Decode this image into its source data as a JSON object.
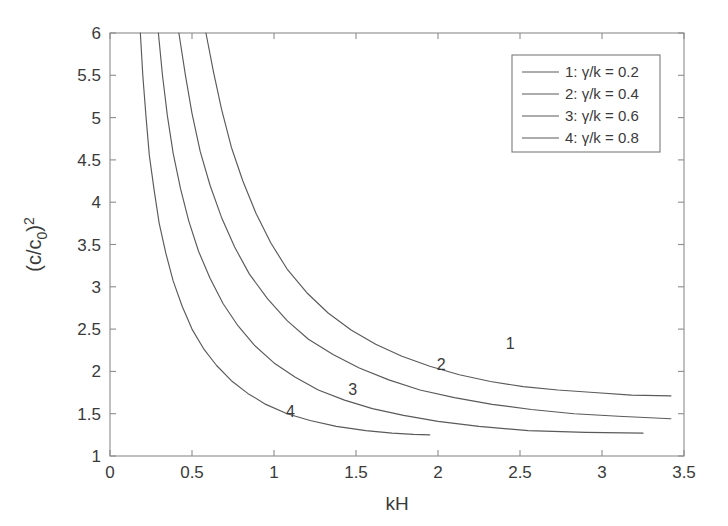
{
  "chart_data": {
    "type": "line",
    "title": "",
    "xlabel": "kH",
    "ylabel": "(c/c_0)^2",
    "ylabel_parts": {
      "base": "(c/c",
      "sub": "0",
      "close": ")",
      "sup": "2"
    },
    "xlim": [
      0,
      3.5
    ],
    "ylim": [
      1,
      6
    ],
    "xticks": [
      "0",
      "0.5",
      "1",
      "1.5",
      "2",
      "2.5",
      "3",
      "3.5"
    ],
    "xtick_values": [
      0,
      0.5,
      1,
      1.5,
      2,
      2.5,
      3,
      3.5
    ],
    "yticks": [
      "1",
      "1.5",
      "2",
      "2.5",
      "3",
      "3.5",
      "4",
      "4.5",
      "5",
      "5.5",
      "6"
    ],
    "ytick_values": [
      1,
      1.5,
      2,
      2.5,
      3,
      3.5,
      4,
      4.5,
      5,
      5.5,
      6
    ],
    "grid": false,
    "legend_position": "upper-right",
    "line_color": "#5a5a5a",
    "axis_color": "#8c8c8c",
    "text_color": "#3a3a3a",
    "series": [
      {
        "name": "1: γ/k = 0.2",
        "curve_label": "1",
        "gamma_over_k": 0.2,
        "label_point": [
          2.44,
          2.26
        ],
        "points": [
          [
            0.585,
            6.0
          ],
          [
            0.63,
            5.55
          ],
          [
            0.68,
            5.1
          ],
          [
            0.74,
            4.65
          ],
          [
            0.81,
            4.25
          ],
          [
            0.89,
            3.87
          ],
          [
            0.98,
            3.52
          ],
          [
            1.08,
            3.21
          ],
          [
            1.2,
            2.93
          ],
          [
            1.33,
            2.69
          ],
          [
            1.47,
            2.49
          ],
          [
            1.62,
            2.32
          ],
          [
            1.78,
            2.18
          ],
          [
            1.95,
            2.06
          ],
          [
            2.13,
            1.96
          ],
          [
            2.32,
            1.88
          ],
          [
            2.52,
            1.82
          ],
          [
            2.73,
            1.78
          ],
          [
            2.95,
            1.75
          ],
          [
            3.18,
            1.72
          ],
          [
            3.42,
            1.71
          ]
        ]
      },
      {
        "name": "2: γ/k = 0.4",
        "curve_label": "2",
        "gamma_over_k": 0.4,
        "label_point": [
          2.02,
          2.02
        ],
        "points": [
          [
            0.42,
            6.0
          ],
          [
            0.46,
            5.5
          ],
          [
            0.5,
            5.05
          ],
          [
            0.55,
            4.6
          ],
          [
            0.61,
            4.2
          ],
          [
            0.68,
            3.82
          ],
          [
            0.76,
            3.47
          ],
          [
            0.85,
            3.15
          ],
          [
            0.96,
            2.86
          ],
          [
            1.08,
            2.6
          ],
          [
            1.21,
            2.38
          ],
          [
            1.36,
            2.2
          ],
          [
            1.52,
            2.04
          ],
          [
            1.7,
            1.9
          ],
          [
            1.89,
            1.78
          ],
          [
            2.1,
            1.69
          ],
          [
            2.33,
            1.61
          ],
          [
            2.57,
            1.55
          ],
          [
            2.83,
            1.5
          ],
          [
            3.1,
            1.47
          ],
          [
            3.42,
            1.44
          ]
        ]
      },
      {
        "name": "3: γ/k = 0.6",
        "curve_label": "3",
        "gamma_over_k": 0.6,
        "label_point": [
          1.48,
          1.72
        ],
        "points": [
          [
            0.295,
            6.0
          ],
          [
            0.32,
            5.5
          ],
          [
            0.35,
            5.02
          ],
          [
            0.385,
            4.58
          ],
          [
            0.43,
            4.16
          ],
          [
            0.48,
            3.78
          ],
          [
            0.54,
            3.42
          ],
          [
            0.61,
            3.1
          ],
          [
            0.69,
            2.8
          ],
          [
            0.78,
            2.54
          ],
          [
            0.88,
            2.31
          ],
          [
            1.0,
            2.1
          ],
          [
            1.13,
            1.93
          ],
          [
            1.27,
            1.78
          ],
          [
            1.43,
            1.66
          ],
          [
            1.6,
            1.56
          ],
          [
            1.79,
            1.48
          ],
          [
            2.0,
            1.41
          ],
          [
            2.25,
            1.35
          ],
          [
            2.55,
            1.3
          ],
          [
            2.9,
            1.28
          ],
          [
            3.25,
            1.27
          ]
        ]
      },
      {
        "name": "4:  γ/k = 0.8",
        "curve_label": "4",
        "gamma_over_k": 0.8,
        "label_point": [
          1.1,
          1.46
        ],
        "points": [
          [
            0.185,
            6.0
          ],
          [
            0.2,
            5.5
          ],
          [
            0.22,
            5.0
          ],
          [
            0.24,
            4.55
          ],
          [
            0.27,
            4.13
          ],
          [
            0.3,
            3.75
          ],
          [
            0.34,
            3.4
          ],
          [
            0.385,
            3.07
          ],
          [
            0.44,
            2.77
          ],
          [
            0.5,
            2.5
          ],
          [
            0.57,
            2.27
          ],
          [
            0.65,
            2.07
          ],
          [
            0.74,
            1.89
          ],
          [
            0.84,
            1.74
          ],
          [
            0.95,
            1.61
          ],
          [
            1.08,
            1.5
          ],
          [
            1.22,
            1.42
          ],
          [
            1.38,
            1.35
          ],
          [
            1.56,
            1.3
          ],
          [
            1.72,
            1.27
          ],
          [
            1.85,
            1.255
          ],
          [
            1.95,
            1.25
          ]
        ]
      }
    ],
    "legend": {
      "entries": [
        "1: γ/k = 0.2",
        "2: γ/k = 0.4",
        "3: γ/k = 0.6",
        "4:  γ/k = 0.8"
      ]
    }
  }
}
